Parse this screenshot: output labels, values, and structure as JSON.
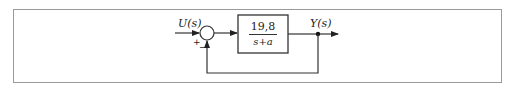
{
  "diagram": {
    "type": "block-diagram",
    "title": "",
    "input_label": "U(s)",
    "output_label": "Y(s)",
    "summing_junction": {
      "plus_sign": "+",
      "minus_sign": "−"
    },
    "transfer_function": {
      "numerator": "19,8",
      "denominator": "s+a"
    },
    "feedback": "unity negative feedback",
    "colors": {
      "stroke": "#333333",
      "frame": "#9a9a9a",
      "background": "#ffffff"
    }
  }
}
